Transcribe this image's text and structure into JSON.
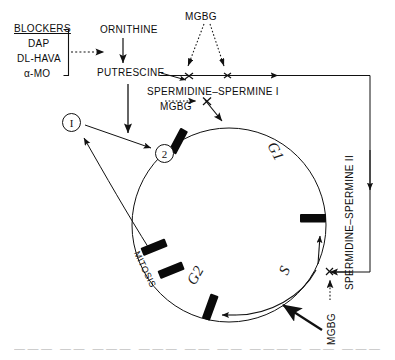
{
  "diagram": {
    "blockers": {
      "heading": "BLOCKERS",
      "items": [
        "DAP",
        "DL-HAVA",
        "α-MO"
      ]
    },
    "metabolites": {
      "ornithine": "ORNITHINE",
      "putrescine": "PUTRESCINE",
      "spermidine_spermine_1": "SPERMIDINE–SPERMINE I",
      "spermidine_spermine_2": "SPERMIDINE–SPERMINE II"
    },
    "inhibitors": {
      "mgbg_top": "MGBG",
      "mgbg_mid": "MGBG",
      "mgbg_bottom": "MGBG"
    },
    "cell_cycle": {
      "phases": [
        "G1",
        "S",
        "G2",
        "MITOSIS"
      ],
      "phase_g1": "G1",
      "phase_s": "S",
      "phase_g2": "G2",
      "phase_mitosis": "MITOSIS"
    },
    "nodes": {
      "node_one": "I",
      "node_two": "2"
    },
    "caption": "——— —— ——— ——— —— —— ———— —— ———",
    "colors": {
      "ink": "#111111",
      "background": "#ffffff",
      "block_bar": "#0a0a0a"
    }
  }
}
